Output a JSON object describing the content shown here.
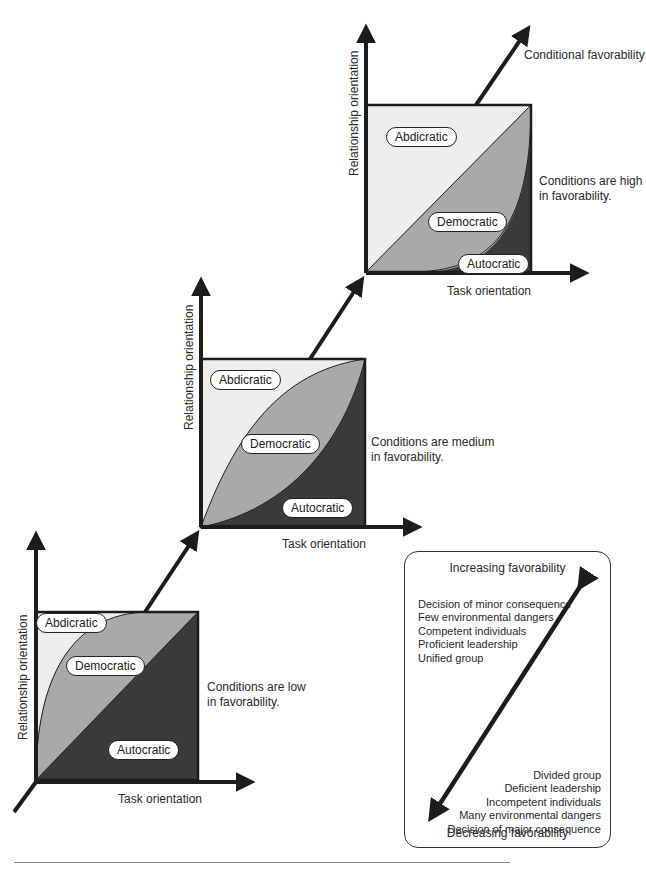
{
  "figure": {
    "overall_axis_label": "Conditional favorability",
    "colors": {
      "abdicratic_fill": "#eeeeee",
      "democratic_fill": "#a9a9a9",
      "autocratic_fill": "#3a3a3a",
      "axis": "#1c1c1c"
    },
    "panels": [
      {
        "id": "low",
        "condition_text_line1": "Conditions are low",
        "condition_text_line2": "in favorability.",
        "x_axis_label": "Task orientation",
        "y_axis_label": "Relationship orientation",
        "regions": {
          "abdicratic": "Abdicratic",
          "democratic": "Democratic",
          "autocratic": "Autocratic"
        }
      },
      {
        "id": "medium",
        "condition_text_line1": "Conditions are medium",
        "condition_text_line2": "in favorability.",
        "x_axis_label": "Task orientation",
        "y_axis_label": "Relationship orientation",
        "regions": {
          "abdicratic": "Abdicratic",
          "democratic": "Democratic",
          "autocratic": "Autocratic"
        }
      },
      {
        "id": "high",
        "condition_text_line1": "Conditions are high",
        "condition_text_line2": "in favorability.",
        "x_axis_label": "Task orientation",
        "y_axis_label": "Relationship orientation",
        "regions": {
          "abdicratic": "Abdicratic",
          "democratic": "Democratic",
          "autocratic": "Autocratic"
        }
      }
    ],
    "legend": {
      "top_title": "Increasing favorability",
      "bottom_title": "Decreasing favorability",
      "increasing_items": [
        "Decision of minor consequence",
        "Few environmental dangers",
        "Competent individuals",
        "Proficient leadership",
        "Unified group"
      ],
      "decreasing_items": [
        "Divided group",
        "Deficient leadership",
        "Incompetent individuals",
        "Many environmental dangers",
        "Decision of major consequence"
      ]
    }
  }
}
